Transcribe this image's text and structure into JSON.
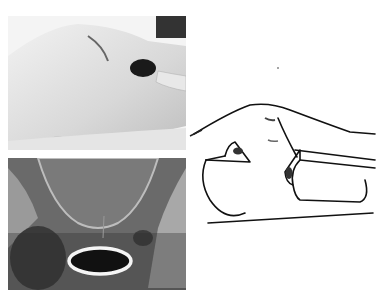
{
  "figure": {
    "panels": [
      {
        "id": "photo",
        "description": "Clinical photograph of a lateral hip/thigh region with a dark opening"
      },
      {
        "id": "xray",
        "description": "Pelvic radiograph with an oval ring-shaped radiopaque object"
      },
      {
        "id": "drawing",
        "description": "Line illustration of the body in lateral view with two openings"
      }
    ],
    "colors": {
      "background": "#ffffff",
      "photo_tone": "#d9d9d9",
      "xray_tone": "#5a5a5a",
      "ring": "#f5f5f5",
      "ink": "#111111"
    }
  }
}
